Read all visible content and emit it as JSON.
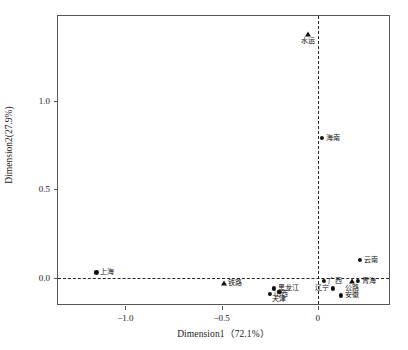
{
  "chart_data": {
    "type": "scatter",
    "title": "",
    "xlabel": "Dimension1（72.1%）",
    "ylabel": "Dimension2(27.9%)",
    "xlim": [
      -1.35,
      0.38
    ],
    "ylim": [
      -0.16,
      1.48
    ],
    "xticks": [
      -1.0,
      -0.5,
      0
    ],
    "xticklabels": [
      "−1.0",
      "−0.5",
      "0"
    ],
    "yticks": [
      0.0,
      0.5,
      1.0
    ],
    "yticklabels": [
      "0.0",
      "0.5",
      "1.0"
    ],
    "grid": false,
    "legend": "none",
    "reference_lines": {
      "horizontal": 0.0,
      "vertical": 0.0,
      "style": "dashed"
    },
    "marker_color": "#111111",
    "series": [
      {
        "name": "地区",
        "marker": "circle",
        "points": [
          {
            "label": "海南",
            "x": 0.02,
            "y": 0.79,
            "label_pos": "right"
          },
          {
            "label": "云南",
            "x": 0.22,
            "y": 0.1,
            "label_pos": "right"
          },
          {
            "label": "上海",
            "x": -1.15,
            "y": 0.03,
            "label_pos": "right"
          },
          {
            "label": "黑龙江",
            "x": -0.23,
            "y": -0.06,
            "label_pos": "right"
          },
          {
            "label": "山西",
            "x": -0.25,
            "y": -0.09,
            "label_pos": "right"
          },
          {
            "label": "天津",
            "x": -0.2,
            "y": -0.08,
            "label_pos": "below"
          },
          {
            "label": "广西",
            "x": 0.03,
            "y": -0.02,
            "label_pos": "right"
          },
          {
            "label": "辽宁",
            "x": 0.08,
            "y": -0.06,
            "label_pos": "left"
          },
          {
            "label": "青海",
            "x": 0.21,
            "y": -0.02,
            "label_pos": "right"
          },
          {
            "label": "安徽",
            "x": 0.12,
            "y": -0.1,
            "label_pos": "right"
          }
        ]
      },
      {
        "name": "运输方式",
        "marker": "triangle",
        "points": [
          {
            "label": "水运",
            "x": -0.05,
            "y": 1.38,
            "label_pos": "below"
          },
          {
            "label": "铁路",
            "x": -0.49,
            "y": -0.03,
            "label_pos": "right"
          },
          {
            "label": "公路",
            "x": 0.175,
            "y": -0.02,
            "label_pos": "below"
          }
        ]
      }
    ]
  }
}
